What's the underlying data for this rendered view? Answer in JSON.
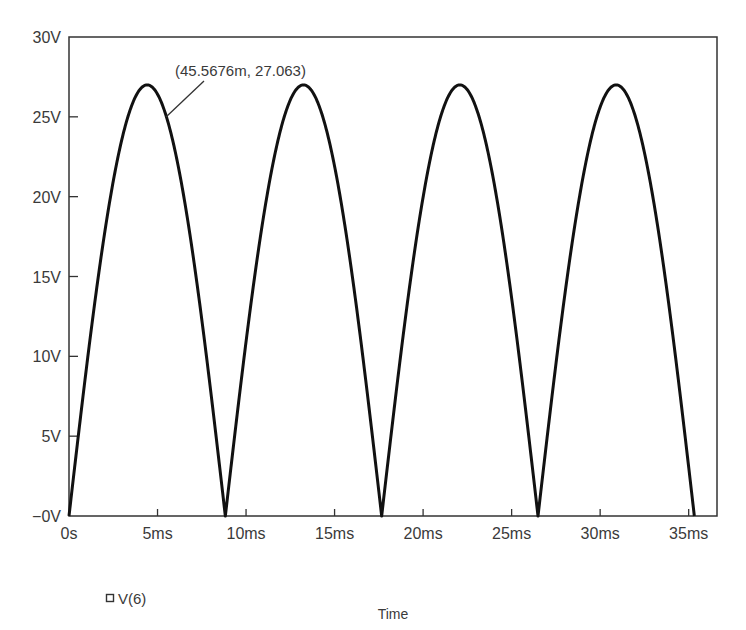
{
  "chart_data": {
    "type": "line",
    "title": "",
    "xlabel": "Time",
    "ylabel": "",
    "xlim": [
      0,
      36.6
    ],
    "ylim": [
      0,
      30
    ],
    "grid": false,
    "legend_position": "bottom-left",
    "x_ticks": [
      {
        "value": 0,
        "label": "0s"
      },
      {
        "value": 5,
        "label": "5ms"
      },
      {
        "value": 10,
        "label": "10ms"
      },
      {
        "value": 15,
        "label": "15ms"
      },
      {
        "value": 20,
        "label": "20ms"
      },
      {
        "value": 25,
        "label": "25ms"
      },
      {
        "value": 30,
        "label": "30ms"
      },
      {
        "value": 35,
        "label": "35ms"
      }
    ],
    "y_ticks": [
      {
        "value": 0,
        "label": "−0V"
      },
      {
        "value": 5,
        "label": "5V"
      },
      {
        "value": 10,
        "label": "10V"
      },
      {
        "value": 15,
        "label": "15V"
      },
      {
        "value": 20,
        "label": "20V"
      },
      {
        "value": 25,
        "label": "25V"
      },
      {
        "value": 30,
        "label": "30V"
      }
    ],
    "series": [
      {
        "name": "V(6)",
        "marker": "square-outline",
        "color": "#111111",
        "shape": "full-wave rectified sine (|sin|)",
        "peak_value": 27.0,
        "half_period_ms": 8.83,
        "zero_crossings_ms": [
          0,
          8.83,
          17.66,
          26.49,
          35.32
        ],
        "peaks_ms": [
          4.4,
          13.2,
          22.1,
          30.9
        ],
        "x_unit": "ms",
        "y_unit": "V"
      }
    ],
    "annotations": [
      {
        "text": "(45.5676m, 27.063)",
        "points_to": {
          "x_ms": 5.5,
          "y_v": 24.8
        }
      }
    ]
  },
  "legend": {
    "items": [
      {
        "label": "V(6)",
        "marker": "square-outline"
      }
    ]
  },
  "colors": {
    "trace": "#111111",
    "frame": "#333333",
    "text": "#3a3a3a",
    "background": "#ffffff"
  }
}
